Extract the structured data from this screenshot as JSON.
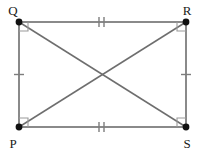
{
  "figure": {
    "canvas": {
      "width": 203,
      "height": 155,
      "background": "#ffffff"
    },
    "colors": {
      "edge": "#8a8a8a",
      "diagonal": "#6e6e6e",
      "vertex_dot": "#111111",
      "right_angle_mark": "#9a9a9a",
      "tick_mark": "#7d7d7d",
      "label_text": "#1a1a1a"
    },
    "vertices": [
      {
        "id": "Q",
        "label": "Q",
        "x": 19,
        "y": 22,
        "label_x": 13,
        "label_y": 15,
        "corner": "top-left"
      },
      {
        "id": "R",
        "label": "R",
        "x": 186,
        "y": 22,
        "label_x": 186,
        "label_y": 15,
        "corner": "top-right"
      },
      {
        "id": "P",
        "label": "P",
        "x": 19,
        "y": 127,
        "label_x": 13,
        "label_y": 147,
        "corner": "bottom-left"
      },
      {
        "id": "S",
        "label": "S",
        "x": 186,
        "y": 127,
        "label_x": 186,
        "label_y": 147,
        "corner": "bottom-right"
      }
    ],
    "edges": [
      {
        "id": "QR",
        "from": "Q",
        "to": "R",
        "side": "top",
        "ticks": 2
      },
      {
        "id": "RS",
        "from": "R",
        "to": "S",
        "side": "right",
        "ticks": 1
      },
      {
        "id": "PS",
        "from": "P",
        "to": "S",
        "side": "bottom",
        "ticks": 2
      },
      {
        "id": "PQ",
        "from": "P",
        "to": "Q",
        "side": "left",
        "ticks": 1
      }
    ],
    "diagonals": [
      {
        "id": "QS",
        "from": "Q",
        "to": "S"
      },
      {
        "id": "PR",
        "from": "P",
        "to": "R"
      }
    ],
    "diagonal_intersection": {
      "x": 102.5,
      "y": 74.5
    },
    "right_angle_marks": [
      {
        "at": "Q",
        "size": 9
      },
      {
        "at": "R",
        "size": 9
      },
      {
        "at": "P",
        "size": 9
      },
      {
        "at": "S",
        "size": 9
      }
    ],
    "tick_marks": [
      {
        "edge": "QR",
        "count": 2,
        "cx": 102.5,
        "cy": 22,
        "orientation": "vertical"
      },
      {
        "edge": "PS",
        "count": 2,
        "cx": 102.5,
        "cy": 127,
        "orientation": "vertical"
      },
      {
        "edge": "PQ",
        "count": 1,
        "cx": 19,
        "cy": 74.5,
        "orientation": "horizontal"
      },
      {
        "edge": "RS",
        "count": 1,
        "cx": 186,
        "cy": 74.5,
        "orientation": "horizontal"
      }
    ]
  }
}
